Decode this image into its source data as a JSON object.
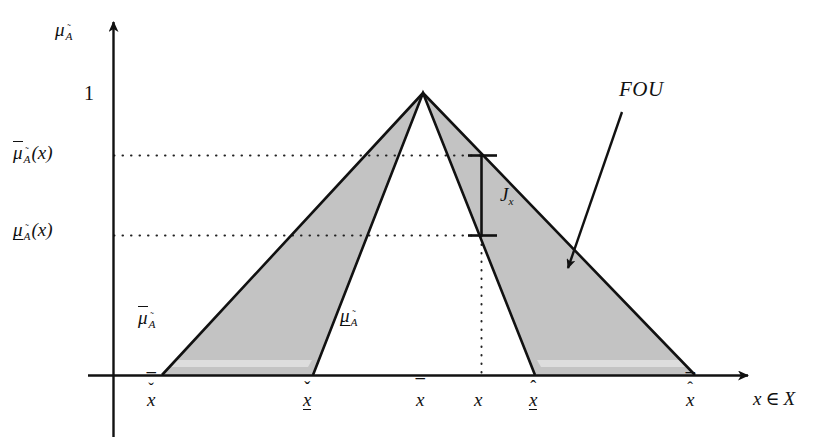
{
  "figure": {
    "type": "diagram",
    "colors": {
      "ink": "#111111",
      "fill_gray": "#c3c3c3",
      "background": "#ffffff"
    }
  },
  "axes": {
    "y_axis_label": {
      "base": "μ",
      "sub": "A",
      "sub_accent": "˜"
    },
    "x_axis_label": {
      "text": "x ∈ X",
      "var": "x",
      "member": "∈",
      "set": "X"
    },
    "y_ticks": [
      {
        "id": "one",
        "label": "1",
        "value": 1.0,
        "y_px": 93
      },
      {
        "id": "upper-mu",
        "label": "μ̄_Ã(x)",
        "base": "μ",
        "accent": "overline",
        "sub": "A",
        "arg": "(x)",
        "value": 0.77,
        "y_px": 155
      },
      {
        "id": "lower-mu",
        "label": "μ̲_Ã(x)",
        "base": "μ",
        "accent": "underline",
        "sub": "A",
        "arg": "(x)",
        "value": 0.49,
        "y_px": 235
      }
    ],
    "x_ticks": [
      {
        "id": "x-overline-caron",
        "base": "x",
        "accents": [
          "overline",
          "caron"
        ],
        "x_px": 157
      },
      {
        "id": "x-caron-underline",
        "base": "x",
        "accents": [
          "caron",
          "underline"
        ],
        "x_px": 312
      },
      {
        "id": "x-overline",
        "base": "x",
        "accents": [
          "overline"
        ],
        "x_px": 424
      },
      {
        "id": "x-plain",
        "base": "x",
        "accents": [],
        "x_px": 481
      },
      {
        "id": "x-hat-underline",
        "base": "x",
        "accents": [
          "hat",
          "underline"
        ],
        "x_px": 538
      },
      {
        "id": "x-overline-hat",
        "base": "x",
        "accents": [
          "overline",
          "hat"
        ],
        "x_px": 696
      }
    ]
  },
  "curves": {
    "umf": {
      "name": "upper membership function",
      "label_base": "μ",
      "label_accent": "overline",
      "label_sub": "A",
      "label_sub_accent": "˜"
    },
    "lmf": {
      "name": "lower membership function",
      "label_base": "μ",
      "label_accent": "underline",
      "label_sub": "A",
      "label_sub_accent": "˜"
    }
  },
  "annotations": {
    "fou": {
      "text": "FOU",
      "meaning": "footprint of uncertainty"
    },
    "jx": {
      "base": "J",
      "sub": "x",
      "meaning": "vertical slice at x"
    }
  }
}
